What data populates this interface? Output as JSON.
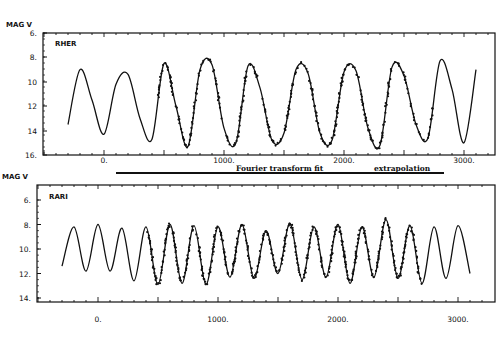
{
  "chart_data": [
    {
      "type": "line",
      "panel": "top",
      "star_label": "RHER",
      "ylabel": "MAG V",
      "xlabel": "",
      "yticks": [
        "6.",
        "8.",
        "10",
        "12",
        "14",
        "16."
      ],
      "ylim": [
        16,
        6
      ],
      "xticks": [
        "0.",
        "1000.",
        "2000.",
        "3000."
      ],
      "xlim": [
        -450,
        3250
      ],
      "series": [
        {
          "name": "Fourier fit / extrapolation (solid curve)",
          "period": 515,
          "x": [
            -300,
            -200,
            -100,
            0,
            100,
            200,
            300,
            400,
            500,
            600,
            700,
            800,
            900,
            1000,
            1100,
            1200,
            1300,
            1400,
            1500,
            1600,
            1700,
            1800,
            1900,
            2000,
            2100,
            2200,
            2300,
            2400,
            2500,
            2600,
            2700,
            2800,
            2900,
            3000,
            3100
          ],
          "y": [
            13.5,
            9.0,
            11.5,
            14.3,
            10.2,
            9.4,
            13.0,
            14.7,
            8.5,
            12.0,
            15.3,
            9.0,
            8.6,
            13.8,
            15.0,
            8.7,
            10.5,
            14.8,
            14.2,
            9.0,
            9.3,
            14.2,
            14.8,
            9.2,
            9.1,
            13.8,
            15.2,
            8.8,
            9.5,
            13.5,
            14.6,
            8.3,
            10.6,
            15.0,
            9.0
          ]
        },
        {
          "name": "Observations (dots)",
          "x_range": [
            450,
            2750
          ],
          "note": "dense points tracking the curve between ~450 and ~2750"
        }
      ]
    },
    {
      "type": "line",
      "panel": "bottom",
      "star_label": "RARI",
      "ylabel": "MAG V",
      "xlabel": "",
      "yticks": [
        "6.",
        "8.",
        "10.",
        "12.",
        "14."
      ],
      "ylim": [
        14.5,
        5
      ],
      "xticks": [
        "0.",
        "1000.",
        "2000.",
        "3000."
      ],
      "xlim": [
        -450,
        3250
      ],
      "series": [
        {
          "name": "Fourier fit / extrapolation (solid curve)",
          "period": 270,
          "x": [
            -300,
            -200,
            -100,
            0,
            100,
            200,
            300,
            400,
            500,
            600,
            700,
            800,
            900,
            1000,
            1100,
            1200,
            1300,
            1400,
            1500,
            1600,
            1700,
            1800,
            1900,
            2000,
            2100,
            2200,
            2300,
            2400,
            2500,
            2600,
            2700,
            2800,
            2900,
            3000,
            3100
          ],
          "y": [
            11.4,
            8.2,
            11.8,
            8.0,
            11.8,
            8.3,
            12.6,
            8.2,
            12.9,
            8.0,
            12.8,
            8.1,
            12.9,
            8.2,
            12.3,
            8.0,
            12.4,
            8.5,
            12.0,
            7.9,
            12.5,
            8.2,
            12.3,
            8.0,
            12.8,
            8.2,
            12.3,
            7.6,
            12.4,
            8.1,
            12.8,
            8.2,
            12.4,
            8.1,
            12.0
          ]
        },
        {
          "name": "Observations (dots)",
          "x_range": [
            400,
            2700
          ],
          "note": "dense points tracking the curve between ~400 and ~2700"
        }
      ]
    }
  ],
  "annotation": {
    "left_text": "Fourier transform fit",
    "right_text": "extrapolation"
  },
  "panels": {
    "top": {
      "star": "RHER",
      "ylabel": "MAG V",
      "yticks": [
        "6.",
        "8.",
        "10",
        "12",
        "14",
        "16."
      ],
      "xticks": [
        "0.",
        "1000.",
        "2000.",
        "3000."
      ]
    },
    "bottom": {
      "star": "RARI",
      "ylabel": "MAG V",
      "yticks": [
        "6.",
        "8.",
        "10.",
        "12.",
        "14."
      ],
      "xticks": [
        "0.",
        "1000.",
        "2000.",
        "3000."
      ]
    }
  }
}
